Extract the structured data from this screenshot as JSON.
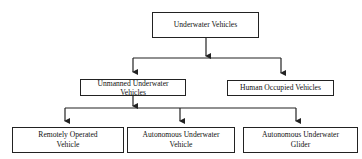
{
  "diagram": {
    "type": "hierarchy",
    "root": {
      "id": "underwater_vehicles",
      "label": "Underwater Vehicles"
    },
    "level1": [
      {
        "id": "unmanned",
        "label": "Unmanned Underwater Vehicles"
      },
      {
        "id": "human_occupied",
        "label": "Human Occupied Vehicles"
      }
    ],
    "level2": [
      {
        "id": "rov",
        "label": "Remotely Operated Vehicle",
        "parent": "unmanned"
      },
      {
        "id": "auv",
        "label": "Autonomous Underwater Vehicle",
        "parent": "unmanned"
      },
      {
        "id": "aug",
        "label": "Autonomous Underwater Glider",
        "parent": "unmanned"
      }
    ],
    "edges": [
      [
        "underwater_vehicles",
        "unmanned"
      ],
      [
        "underwater_vehicles",
        "human_occupied"
      ],
      [
        "unmanned",
        "rov"
      ],
      [
        "unmanned",
        "auv"
      ],
      [
        "unmanned",
        "aug"
      ]
    ],
    "colors": {
      "line": "#222222",
      "background": "#ffffff",
      "text": "#111111"
    }
  }
}
